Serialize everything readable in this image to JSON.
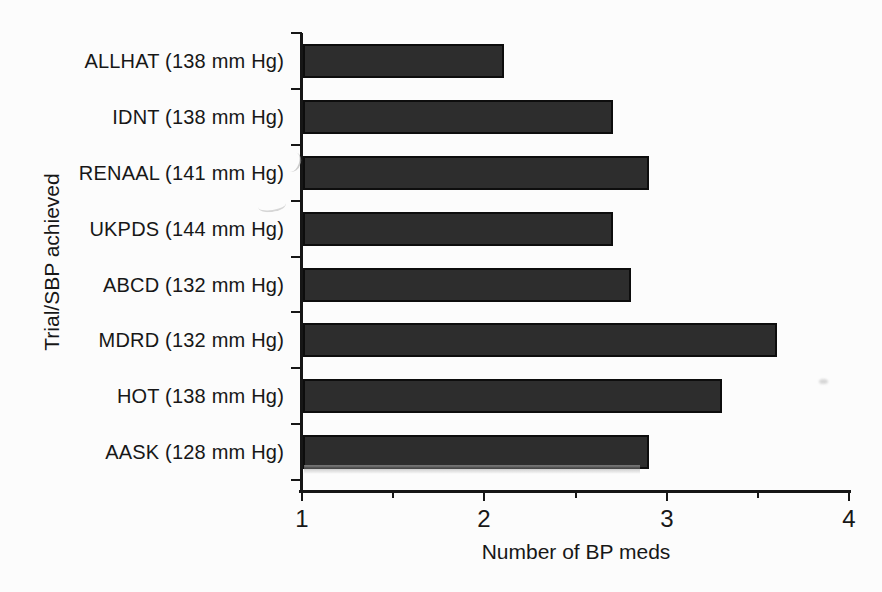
{
  "figure": {
    "background": "#fcfcfc",
    "bar_color": "#2d2d2d",
    "bar_border_color": "#0d0d0d",
    "axis_color": "#161616",
    "text_color": "#171717"
  },
  "chart_data": {
    "type": "bar",
    "orientation": "horizontal",
    "title": "",
    "xlabel": "Number of BP meds",
    "ylabel": "Trial/SBP achieved",
    "categories": [
      "ALLHAT (138 mm Hg)",
      "IDNT (138 mm Hg)",
      "RENAAL (141 mm Hg)",
      "UKPDS (144 mm Hg)",
      "ABCD (132 mm Hg)",
      "MDRD (132 mm Hg)",
      "HOT (138 mm Hg)",
      "AASK (128 mm Hg)"
    ],
    "values": [
      2.1,
      2.7,
      2.9,
      2.7,
      2.8,
      3.6,
      3.3,
      2.9
    ],
    "xlim": [
      1,
      4
    ],
    "x_major_ticks": [
      1,
      2,
      3,
      4
    ],
    "x_minor_ticks": [
      1.5,
      2.5,
      3.5
    ],
    "grid": false,
    "legend": null,
    "bar_style": "solid dark fill, black outline"
  }
}
